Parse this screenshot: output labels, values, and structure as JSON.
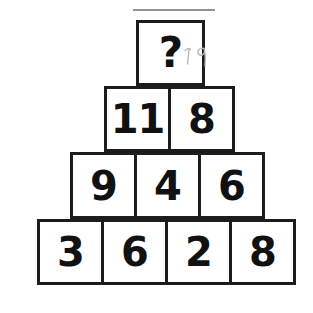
{
  "image": {
    "title": "Number pyramid puzzle",
    "background_color": "#ffffff",
    "ink_color": "#1c1c1c",
    "pencil_color": "#b9b9b9"
  },
  "puzzle": {
    "type": "number-pyramid",
    "rows": [
      {
        "level": 1,
        "cells": [
          {
            "value": "?",
            "unknown": true
          }
        ]
      },
      {
        "level": 2,
        "cells": [
          {
            "value": "11",
            "unknown": false
          },
          {
            "value": "8",
            "unknown": false
          }
        ]
      },
      {
        "level": 3,
        "cells": [
          {
            "value": "9",
            "unknown": false
          },
          {
            "value": "4",
            "unknown": false
          },
          {
            "value": "6",
            "unknown": false
          }
        ]
      },
      {
        "level": 4,
        "cells": [
          {
            "value": "3",
            "unknown": false
          },
          {
            "value": "6",
            "unknown": false
          },
          {
            "value": "2",
            "unknown": false
          },
          {
            "value": "8",
            "unknown": false
          }
        ]
      }
    ],
    "annotation": {
      "text": "19",
      "style": "handwritten-pencil",
      "near": "top-cell"
    }
  }
}
